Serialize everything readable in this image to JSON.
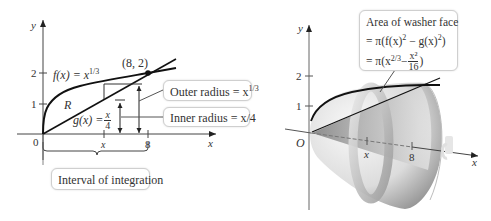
{
  "left_figure": {
    "axes": {
      "x_label": "x",
      "y_label": "y",
      "origin_label": "0",
      "y_ticks": [
        "1",
        "2"
      ],
      "x_ticks": [
        "x",
        "8"
      ]
    },
    "curves": {
      "f_label": "f(x) = x",
      "f_exponent": "1/3",
      "g_label": "g(x) = ",
      "g_frac_num": "x",
      "g_frac_den": "4"
    },
    "region_label": "R",
    "intersection_point": "(8, 2)",
    "callouts": {
      "outer_radius": "Outer radius = x",
      "outer_radius_exp": "1/3",
      "inner_radius": "Inner radius = x/4",
      "interval": "Interval of integration"
    }
  },
  "right_figure": {
    "axes": {
      "x_label": "x",
      "y_label": "y",
      "origin_label": "O",
      "y_ticks": [
        "1",
        "2"
      ],
      "x_ticks": [
        "x",
        "8"
      ]
    },
    "callout": {
      "line1": "Area of washer face",
      "line2_prefix": "= π(f(x)",
      "line2_mid": " − g(x)",
      "line2_suffix": ")",
      "line3_prefix": "= π(x",
      "line3_exp": "2/3",
      "line3_minus": " − ",
      "line3_frac_num": "x²",
      "line3_frac_den": "16",
      "line3_suffix": ")"
    }
  },
  "colors": {
    "stroke": "#111111",
    "axis": "#555555",
    "callout_border": "#cfcfcf",
    "solid_light": "#f2f2f2",
    "solid_dark": "#8a8a8a"
  }
}
